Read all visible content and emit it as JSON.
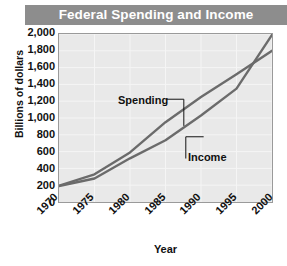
{
  "chart_data": {
    "type": "line",
    "title": "Federal Spending and Income",
    "xlabel": "Year",
    "ylabel": "Billions of dollars",
    "x": [
      1970,
      1975,
      1980,
      1985,
      1990,
      1995,
      2000
    ],
    "xlim": [
      1970,
      2000
    ],
    "ylim": [
      0,
      2000
    ],
    "xticks": [
      "1970",
      "1975",
      "1980",
      "1985",
      "1990",
      "1995",
      "2000"
    ],
    "yticks": [
      "0",
      "200",
      "400",
      "600",
      "800",
      "1,000",
      "1,200",
      "1,400",
      "1,600",
      "1,800",
      "2,000"
    ],
    "grid": true,
    "legend_position": "inline-annotations",
    "series": [
      {
        "name": "Spending",
        "values": [
          195,
          330,
          590,
          950,
          1250,
          1520,
          1800
        ],
        "color": "#6b6b6b"
      },
      {
        "name": "Income",
        "values": [
          190,
          280,
          520,
          735,
          1030,
          1350,
          1990
        ],
        "color": "#6b6b6b"
      }
    ],
    "annotations": [
      {
        "text": "Spending",
        "points_to_series": "Spending"
      },
      {
        "text": "Income",
        "points_to_series": "Income"
      }
    ],
    "colors": {
      "title_band": "#8d8d8d",
      "title_text": "#ffffff",
      "plot_background": "#e9e9e9",
      "gridline": "#f5f5f5",
      "frame": "#9a9a9a",
      "line": "#6b6b6b",
      "text": "#111111"
    }
  }
}
